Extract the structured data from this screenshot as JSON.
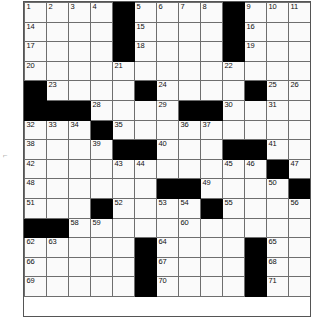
{
  "puzzle": {
    "title": "Crossword Puzzle Grid",
    "columns": 13,
    "rows": 16,
    "colors": {
      "block": "#000000",
      "cell": "#fafafa",
      "gridline": "#6e6e6e",
      "number": "#111111",
      "page": "#ffffff"
    },
    "margin_tick": "⌐",
    "grid": [
      [
        {
          "block": false,
          "num": "1"
        },
        {
          "block": false,
          "num": "2"
        },
        {
          "block": false,
          "num": "3"
        },
        {
          "block": false,
          "num": "4"
        },
        {
          "block": true,
          "num": ""
        },
        {
          "block": false,
          "num": "5"
        },
        {
          "block": false,
          "num": "6"
        },
        {
          "block": false,
          "num": "7"
        },
        {
          "block": false,
          "num": "8"
        },
        {
          "block": true,
          "num": ""
        },
        {
          "block": false,
          "num": "9"
        },
        {
          "block": false,
          "num": "10"
        },
        {
          "block": false,
          "num": "11"
        },
        {
          "block": false,
          "num": "12"
        },
        {
          "block": false,
          "num": "13"
        }
      ],
      [
        {
          "block": false,
          "num": "14"
        },
        {
          "block": false,
          "num": ""
        },
        {
          "block": false,
          "num": ""
        },
        {
          "block": false,
          "num": ""
        },
        {
          "block": true,
          "num": ""
        },
        {
          "block": false,
          "num": "15"
        },
        {
          "block": false,
          "num": ""
        },
        {
          "block": false,
          "num": ""
        },
        {
          "block": false,
          "num": ""
        },
        {
          "block": true,
          "num": ""
        },
        {
          "block": false,
          "num": "16"
        },
        {
          "block": false,
          "num": ""
        },
        {
          "block": false,
          "num": ""
        },
        {
          "block": false,
          "num": ""
        },
        {
          "block": false,
          "num": ""
        }
      ],
      [
        {
          "block": false,
          "num": "17"
        },
        {
          "block": false,
          "num": ""
        },
        {
          "block": false,
          "num": ""
        },
        {
          "block": false,
          "num": ""
        },
        {
          "block": true,
          "num": ""
        },
        {
          "block": false,
          "num": "18"
        },
        {
          "block": false,
          "num": ""
        },
        {
          "block": false,
          "num": ""
        },
        {
          "block": false,
          "num": ""
        },
        {
          "block": true,
          "num": ""
        },
        {
          "block": false,
          "num": "19"
        },
        {
          "block": false,
          "num": ""
        },
        {
          "block": false,
          "num": ""
        },
        {
          "block": false,
          "num": ""
        },
        {
          "block": false,
          "num": ""
        }
      ],
      [
        {
          "block": false,
          "num": "20"
        },
        {
          "block": false,
          "num": ""
        },
        {
          "block": false,
          "num": ""
        },
        {
          "block": false,
          "num": ""
        },
        {
          "block": false,
          "num": "21"
        },
        {
          "block": false,
          "num": ""
        },
        {
          "block": false,
          "num": ""
        },
        {
          "block": false,
          "num": ""
        },
        {
          "block": false,
          "num": ""
        },
        {
          "block": false,
          "num": "22"
        },
        {
          "block": false,
          "num": ""
        },
        {
          "block": false,
          "num": ""
        },
        {
          "block": false,
          "num": ""
        },
        {
          "block": true,
          "num": ""
        },
        {
          "block": true,
          "num": ""
        }
      ],
      [
        {
          "block": true,
          "num": ""
        },
        {
          "block": false,
          "num": "23"
        },
        {
          "block": false,
          "num": ""
        },
        {
          "block": false,
          "num": ""
        },
        {
          "block": false,
          "num": ""
        },
        {
          "block": true,
          "num": ""
        },
        {
          "block": false,
          "num": "24"
        },
        {
          "block": false,
          "num": ""
        },
        {
          "block": false,
          "num": ""
        },
        {
          "block": false,
          "num": ""
        },
        {
          "block": true,
          "num": ""
        },
        {
          "block": false,
          "num": "25"
        },
        {
          "block": false,
          "num": "26"
        },
        {
          "block": false,
          "num": "27"
        },
        {
          "block": false,
          "num": ""
        }
      ],
      [
        {
          "block": true,
          "num": ""
        },
        {
          "block": true,
          "num": ""
        },
        {
          "block": true,
          "num": ""
        },
        {
          "block": false,
          "num": "28"
        },
        {
          "block": false,
          "num": ""
        },
        {
          "block": false,
          "num": ""
        },
        {
          "block": false,
          "num": "29"
        },
        {
          "block": true,
          "num": ""
        },
        {
          "block": true,
          "num": ""
        },
        {
          "block": false,
          "num": "30"
        },
        {
          "block": false,
          "num": ""
        },
        {
          "block": false,
          "num": "31"
        },
        {
          "block": false,
          "num": ""
        },
        {
          "block": false,
          "num": ""
        },
        {
          "block": false,
          "num": ""
        }
      ],
      [
        {
          "block": false,
          "num": "32"
        },
        {
          "block": false,
          "num": "33"
        },
        {
          "block": false,
          "num": "34"
        },
        {
          "block": true,
          "num": ""
        },
        {
          "block": false,
          "num": "35"
        },
        {
          "block": false,
          "num": ""
        },
        {
          "block": false,
          "num": ""
        },
        {
          "block": false,
          "num": "36"
        },
        {
          "block": false,
          "num": "37"
        },
        {
          "block": false,
          "num": ""
        },
        {
          "block": false,
          "num": ""
        },
        {
          "block": false,
          "num": ""
        },
        {
          "block": false,
          "num": ""
        },
        {
          "block": false,
          "num": ""
        },
        {
          "block": false,
          "num": ""
        }
      ],
      [
        {
          "block": false,
          "num": "38"
        },
        {
          "block": false,
          "num": ""
        },
        {
          "block": false,
          "num": ""
        },
        {
          "block": false,
          "num": "39"
        },
        {
          "block": true,
          "num": ""
        },
        {
          "block": true,
          "num": ""
        },
        {
          "block": false,
          "num": "40"
        },
        {
          "block": false,
          "num": ""
        },
        {
          "block": false,
          "num": ""
        },
        {
          "block": true,
          "num": ""
        },
        {
          "block": true,
          "num": ""
        },
        {
          "block": false,
          "num": "41"
        },
        {
          "block": false,
          "num": ""
        },
        {
          "block": false,
          "num": ""
        },
        {
          "block": false,
          "num": ""
        }
      ],
      [
        {
          "block": false,
          "num": "42"
        },
        {
          "block": false,
          "num": ""
        },
        {
          "block": false,
          "num": ""
        },
        {
          "block": false,
          "num": ""
        },
        {
          "block": false,
          "num": "43"
        },
        {
          "block": false,
          "num": "44"
        },
        {
          "block": false,
          "num": ""
        },
        {
          "block": false,
          "num": ""
        },
        {
          "block": false,
          "num": ""
        },
        {
          "block": false,
          "num": "45"
        },
        {
          "block": false,
          "num": "46"
        },
        {
          "block": true,
          "num": ""
        },
        {
          "block": false,
          "num": "47"
        },
        {
          "block": false,
          "num": ""
        },
        {
          "block": false,
          "num": ""
        }
      ],
      [
        {
          "block": false,
          "num": "48"
        },
        {
          "block": false,
          "num": ""
        },
        {
          "block": false,
          "num": ""
        },
        {
          "block": false,
          "num": ""
        },
        {
          "block": false,
          "num": ""
        },
        {
          "block": false,
          "num": ""
        },
        {
          "block": true,
          "num": ""
        },
        {
          "block": true,
          "num": ""
        },
        {
          "block": false,
          "num": "49"
        },
        {
          "block": false,
          "num": ""
        },
        {
          "block": false,
          "num": ""
        },
        {
          "block": false,
          "num": "50"
        },
        {
          "block": true,
          "num": ""
        },
        {
          "block": true,
          "num": ""
        },
        {
          "block": true,
          "num": ""
        }
      ],
      [
        {
          "block": false,
          "num": "51"
        },
        {
          "block": false,
          "num": ""
        },
        {
          "block": false,
          "num": ""
        },
        {
          "block": true,
          "num": ""
        },
        {
          "block": false,
          "num": "52"
        },
        {
          "block": false,
          "num": ""
        },
        {
          "block": false,
          "num": "53"
        },
        {
          "block": false,
          "num": "54"
        },
        {
          "block": true,
          "num": ""
        },
        {
          "block": false,
          "num": "55"
        },
        {
          "block": false,
          "num": ""
        },
        {
          "block": false,
          "num": ""
        },
        {
          "block": false,
          "num": "56"
        },
        {
          "block": false,
          "num": "57"
        },
        {
          "block": true,
          "num": ""
        }
      ],
      [
        {
          "block": true,
          "num": ""
        },
        {
          "block": true,
          "num": ""
        },
        {
          "block": false,
          "num": "58"
        },
        {
          "block": false,
          "num": "59"
        },
        {
          "block": false,
          "num": ""
        },
        {
          "block": false,
          "num": ""
        },
        {
          "block": false,
          "num": ""
        },
        {
          "block": false,
          "num": "60"
        },
        {
          "block": false,
          "num": ""
        },
        {
          "block": false,
          "num": ""
        },
        {
          "block": false,
          "num": ""
        },
        {
          "block": false,
          "num": ""
        },
        {
          "block": false,
          "num": ""
        },
        {
          "block": false,
          "num": ""
        },
        {
          "block": false,
          "num": "61"
        }
      ],
      [
        {
          "block": false,
          "num": "62"
        },
        {
          "block": false,
          "num": "63"
        },
        {
          "block": false,
          "num": ""
        },
        {
          "block": false,
          "num": ""
        },
        {
          "block": false,
          "num": ""
        },
        {
          "block": true,
          "num": ""
        },
        {
          "block": false,
          "num": "64"
        },
        {
          "block": false,
          "num": ""
        },
        {
          "block": false,
          "num": ""
        },
        {
          "block": false,
          "num": ""
        },
        {
          "block": true,
          "num": ""
        },
        {
          "block": false,
          "num": "65"
        },
        {
          "block": false,
          "num": ""
        },
        {
          "block": false,
          "num": ""
        },
        {
          "block": false,
          "num": ""
        }
      ],
      [
        {
          "block": false,
          "num": "66"
        },
        {
          "block": false,
          "num": ""
        },
        {
          "block": false,
          "num": ""
        },
        {
          "block": false,
          "num": ""
        },
        {
          "block": false,
          "num": ""
        },
        {
          "block": true,
          "num": ""
        },
        {
          "block": false,
          "num": "67"
        },
        {
          "block": false,
          "num": ""
        },
        {
          "block": false,
          "num": ""
        },
        {
          "block": false,
          "num": ""
        },
        {
          "block": true,
          "num": ""
        },
        {
          "block": false,
          "num": "68"
        },
        {
          "block": false,
          "num": ""
        },
        {
          "block": false,
          "num": ""
        },
        {
          "block": false,
          "num": ""
        }
      ],
      [
        {
          "block": false,
          "num": "69"
        },
        {
          "block": false,
          "num": ""
        },
        {
          "block": false,
          "num": ""
        },
        {
          "block": false,
          "num": ""
        },
        {
          "block": false,
          "num": ""
        },
        {
          "block": true,
          "num": ""
        },
        {
          "block": false,
          "num": "70"
        },
        {
          "block": false,
          "num": ""
        },
        {
          "block": false,
          "num": ""
        },
        {
          "block": false,
          "num": ""
        },
        {
          "block": true,
          "num": ""
        },
        {
          "block": false,
          "num": "71"
        },
        {
          "block": false,
          "num": ""
        },
        {
          "block": false,
          "num": ""
        },
        {
          "block": false,
          "num": ""
        }
      ]
    ]
  }
}
